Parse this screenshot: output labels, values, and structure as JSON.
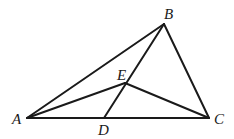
{
  "diagram": {
    "type": "geometry",
    "stroke_color": "#1a1a1a",
    "points": {
      "A": {
        "label": "A",
        "x": 27,
        "y": 118,
        "label_x": 12,
        "label_y": 124
      },
      "B": {
        "label": "B",
        "x": 164,
        "y": 24,
        "label_x": 164,
        "label_y": 19
      },
      "C": {
        "label": "C",
        "x": 209,
        "y": 118,
        "label_x": 214,
        "label_y": 124
      },
      "D": {
        "label": "D",
        "x": 104,
        "y": 118,
        "label_x": 98,
        "label_y": 135
      },
      "E": {
        "label": "E",
        "x": 125,
        "y": 83,
        "label_x": 117,
        "label_y": 80
      }
    },
    "segments": [
      {
        "name": "AB",
        "from": "A",
        "to": "B"
      },
      {
        "name": "BC",
        "from": "B",
        "to": "C"
      },
      {
        "name": "AC",
        "from": "A",
        "to": "C"
      },
      {
        "name": "BD",
        "from": "B",
        "to": "D"
      },
      {
        "name": "AE",
        "from": "A",
        "to": "E"
      },
      {
        "name": "EC",
        "from": "E",
        "to": "C"
      }
    ]
  }
}
